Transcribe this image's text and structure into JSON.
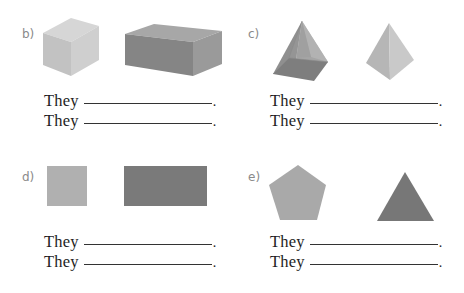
{
  "exercises": [
    {
      "label": "b)",
      "shapes": [
        "cube",
        "cuboid"
      ],
      "lines": [
        {
          "prefix": "They",
          "blank": "",
          "suffix": "."
        },
        {
          "prefix": "They",
          "blank": "",
          "suffix": "."
        }
      ]
    },
    {
      "label": "c)",
      "shapes": [
        "square-pyramid",
        "triangular-pyramid"
      ],
      "lines": [
        {
          "prefix": "They",
          "blank": "",
          "suffix": "."
        },
        {
          "prefix": "They",
          "blank": "",
          "suffix": "."
        }
      ]
    },
    {
      "label": "d)",
      "shapes": [
        "square",
        "rectangle"
      ],
      "lines": [
        {
          "prefix": "They",
          "blank": "",
          "suffix": "."
        },
        {
          "prefix": "They",
          "blank": "",
          "suffix": "."
        }
      ]
    },
    {
      "label": "e)",
      "shapes": [
        "pentagon",
        "triangle"
      ],
      "lines": [
        {
          "prefix": "They",
          "blank": "",
          "suffix": "."
        },
        {
          "prefix": "They",
          "blank": "",
          "suffix": "."
        }
      ]
    }
  ],
  "colors": {
    "light_gray": "#b4b4b4",
    "mid_gray": "#999999",
    "dark_gray": "#777777",
    "label_gray": "#8a8a8a",
    "text": "#1e1e1e"
  }
}
